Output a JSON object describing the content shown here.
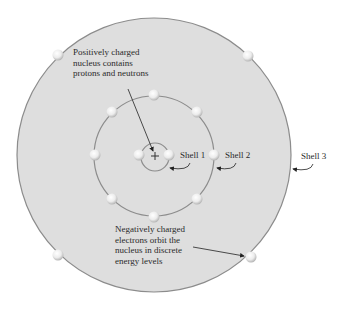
{
  "diagram": {
    "type": "bohr-atom-model",
    "colors": {
      "outer_fill": "#dcdcdc",
      "ring_stroke": "#8a8a8a",
      "electron_fill": "#f4f4f4",
      "text": "#2a2a2a",
      "arrow": "#222222"
    },
    "nucleus": {
      "symbol": "+"
    },
    "shells": [
      {
        "name": "Shell 1",
        "label": "Shell 1",
        "electron_count": 2
      },
      {
        "name": "Shell 2",
        "label": "Shell 2",
        "electron_count": 8
      },
      {
        "name": "Shell 3",
        "label": "Shell 3",
        "electron_count": 4
      }
    ],
    "annotations": {
      "nucleus_note": {
        "line1": "Positively charged",
        "line2": "nucleus contains",
        "line3": "protons and neutrons"
      },
      "electron_note": {
        "line1": "Negatively charged",
        "line2": "electrons orbit the",
        "line3": "nucleus in discrete",
        "line4": "energy levels"
      }
    }
  }
}
